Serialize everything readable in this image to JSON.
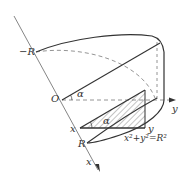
{
  "diagram": {
    "type": "3d-solid-cross-section",
    "labels": {
      "neg_r": "−R",
      "origin": "O",
      "alpha_top": "α",
      "alpha_section": "α",
      "x_point": "x",
      "y_point": "y",
      "r_point": "R",
      "x_axis": "x",
      "y_axis": "y",
      "equation": "x²+y²=R²"
    },
    "colors": {
      "line": "#333333",
      "dashed": "#888888",
      "axis": "#777777",
      "hatch": "#555555"
    }
  }
}
